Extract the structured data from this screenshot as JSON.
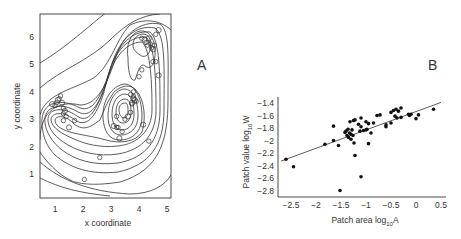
{
  "chart_data": [
    {
      "panel": "A",
      "type": "scatter",
      "subtype": "contour with open-circle points",
      "xlabel": "x coordinate",
      "ylabel": "y coordinate",
      "xticks": [
        1,
        2,
        3,
        4,
        5
      ],
      "yticks": [
        1,
        2,
        3,
        4,
        5,
        6
      ],
      "xlim": [
        0.5,
        5.1
      ],
      "ylim": [
        0.3,
        6.8
      ],
      "grid": false,
      "points": [
        [
          0.9,
          3.55
        ],
        [
          1.0,
          3.5
        ],
        [
          1.05,
          3.6
        ],
        [
          1.1,
          3.7
        ],
        [
          1.15,
          3.75
        ],
        [
          1.2,
          3.85
        ],
        [
          1.25,
          3.6
        ],
        [
          1.3,
          3.4
        ],
        [
          1.3,
          3.2
        ],
        [
          1.35,
          3.3
        ],
        [
          1.4,
          3.1
        ],
        [
          1.3,
          2.95
        ],
        [
          1.5,
          2.7
        ],
        [
          1.7,
          2.95
        ],
        [
          3.2,
          3.1
        ],
        [
          3.1,
          2.75
        ],
        [
          3.2,
          2.7
        ],
        [
          3.25,
          2.7
        ],
        [
          3.3,
          2.3
        ],
        [
          3.4,
          2.55
        ],
        [
          3.5,
          3.0
        ],
        [
          3.6,
          3.1
        ],
        [
          3.7,
          3.25
        ],
        [
          3.75,
          3.55
        ],
        [
          3.8,
          3.75
        ],
        [
          3.7,
          3.9
        ],
        [
          3.8,
          3.85
        ],
        [
          3.85,
          3.7
        ],
        [
          3.9,
          3.65
        ],
        [
          3.8,
          4.0
        ],
        [
          3.75,
          3.6
        ],
        [
          4.1,
          4.8
        ],
        [
          4.0,
          4.55
        ],
        [
          4.15,
          2.8
        ],
        [
          4.35,
          2.2
        ],
        [
          4.1,
          5.95
        ],
        [
          4.2,
          5.9
        ],
        [
          4.25,
          5.8
        ],
        [
          4.3,
          5.7
        ],
        [
          4.35,
          5.95
        ],
        [
          4.4,
          5.75
        ],
        [
          4.45,
          5.6
        ],
        [
          4.5,
          5.55
        ],
        [
          4.55,
          5.7
        ],
        [
          4.6,
          6.1
        ],
        [
          4.7,
          6.25
        ],
        [
          4.5,
          5.1
        ],
        [
          4.6,
          5.1
        ],
        [
          4.7,
          4.6
        ],
        [
          2.6,
          1.6
        ],
        [
          2.05,
          0.8
        ]
      ]
    },
    {
      "panel": "B",
      "type": "scatter",
      "subtype": "scatter with linear regression line",
      "xlabel": "Patch area log10A",
      "ylabel": "Patch value log10W",
      "xticks": [
        -2.5,
        -2,
        -1.5,
        -1,
        -0.5,
        0,
        0.5
      ],
      "yticks": [
        -1.4,
        -1.6,
        -1.8,
        -2,
        -2.2,
        -2.4,
        -2.6,
        -2.8
      ],
      "xlim": [
        -2.75,
        0.6
      ],
      "ylim": [
        -2.85,
        -1.3
      ],
      "grid": false,
      "fit_line": {
        "x": [
          -2.7,
          0.5
        ],
        "y": [
          -2.33,
          -1.39
        ]
      },
      "points": [
        [
          -2.6,
          -2.3
        ],
        [
          -2.45,
          -2.42
        ],
        [
          -1.82,
          -2.06
        ],
        [
          -1.65,
          -1.77
        ],
        [
          -1.65,
          -2.0
        ],
        [
          -1.55,
          -2.08
        ],
        [
          -1.52,
          -2.8
        ],
        [
          -1.42,
          -1.87
        ],
        [
          -1.4,
          -1.85
        ],
        [
          -1.38,
          -1.92
        ],
        [
          -1.36,
          -1.82
        ],
        [
          -1.35,
          -1.95
        ],
        [
          -1.33,
          -1.88
        ],
        [
          -1.32,
          -1.7
        ],
        [
          -1.3,
          -1.9
        ],
        [
          -1.3,
          -1.98
        ],
        [
          -1.28,
          -1.83
        ],
        [
          -1.26,
          -1.92
        ],
        [
          -1.25,
          -1.68
        ],
        [
          -1.24,
          -2.04
        ],
        [
          -1.22,
          -1.67
        ],
        [
          -1.22,
          -2.24
        ],
        [
          -1.15,
          -1.74
        ],
        [
          -1.12,
          -1.85
        ],
        [
          -1.1,
          -1.64
        ],
        [
          -1.1,
          -1.78
        ],
        [
          -1.1,
          -2.58
        ],
        [
          -1.05,
          -1.84
        ],
        [
          -1.0,
          -1.83
        ],
        [
          -1.0,
          -1.7
        ],
        [
          -0.98,
          -1.82
        ],
        [
          -0.95,
          -2.05
        ],
        [
          -0.95,
          -1.73
        ],
        [
          -0.9,
          -1.88
        ],
        [
          -0.85,
          -1.72
        ],
        [
          -0.78,
          -1.6
        ],
        [
          -0.72,
          -1.59
        ],
        [
          -0.6,
          -1.78
        ],
        [
          -0.6,
          -1.75
        ],
        [
          -0.5,
          -1.55
        ],
        [
          -0.5,
          -1.72
        ],
        [
          -0.45,
          -1.52
        ],
        [
          -0.42,
          -1.61
        ],
        [
          -0.4,
          -1.5
        ],
        [
          -0.38,
          -1.64
        ],
        [
          -0.35,
          -1.53
        ],
        [
          -0.3,
          -1.48
        ],
        [
          -0.3,
          -1.63
        ],
        [
          -0.15,
          -1.58
        ],
        [
          -0.13,
          -1.6
        ],
        [
          -0.1,
          -1.58
        ],
        [
          0.0,
          -1.65
        ],
        [
          0.05,
          -1.59
        ],
        [
          0.35,
          -1.5
        ]
      ]
    }
  ],
  "panels": {
    "a": {
      "letter": "A",
      "xlabel": "x coordinate",
      "ylabel": "y coordinate",
      "xticks": [
        "1",
        "2",
        "3",
        "4",
        "5"
      ],
      "yticks": [
        "1",
        "2",
        "3",
        "4",
        "5",
        "6"
      ]
    },
    "b": {
      "letter": "B",
      "xlabel_main": "Patch area log",
      "xlabel_sub": "10",
      "xlabel_tail": "A",
      "ylabel_main": "Patch value log",
      "ylabel_sub": "10",
      "ylabel_tail": "W",
      "xticks": [
        "−2.5",
        "−2",
        "−1.5",
        "−1",
        "−0.5",
        "0",
        "0.5"
      ],
      "yticks": [
        "−1.4",
        "−1.6",
        "−1.8",
        "−2",
        "−2.2",
        "−2.4",
        "−2.6",
        "−2.8"
      ]
    }
  }
}
